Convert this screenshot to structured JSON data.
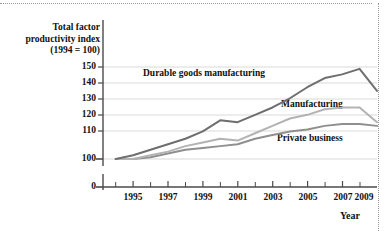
{
  "chart_data": {
    "type": "line",
    "title": "",
    "ylabel": "Total factor productivity index (1994 = 100)",
    "ylabel_line1": "Total factor",
    "ylabel_line2": "productivity index",
    "ylabel_line3": "(1994 = 100)",
    "xlabel": "Year",
    "grid": true,
    "legend_position": "inline-annotations",
    "ylim": [
      100,
      155
    ],
    "y_axis_break": true,
    "y_zero_tick": "0",
    "yticks": [
      100,
      110,
      120,
      130,
      140,
      150
    ],
    "ytick_labels": [
      "100",
      "110",
      "120",
      "130",
      "140",
      "150"
    ],
    "xlim": [
      1994,
      2009.5
    ],
    "xticks_major": [
      1995,
      1997,
      1999,
      2001,
      2003,
      2005,
      2007,
      2009
    ],
    "xtick_labels": [
      "1995",
      "1997",
      "1999",
      "2001",
      "2003",
      "2005",
      "2007",
      "2009"
    ],
    "xticks_minor": [
      1994,
      1996,
      1998,
      2000,
      2002,
      2004,
      2006,
      2008
    ],
    "x": [
      1994,
      1995,
      1996,
      1997,
      1998,
      1999,
      2000,
      2001,
      2002,
      2003,
      2004,
      2005,
      2006,
      2007,
      2008,
      2009
    ],
    "series": [
      {
        "name": "Durable goods manufacturing",
        "color": "#6e6e6e",
        "values": [
          100,
          102,
          105,
          108,
          111,
          115,
          121,
          120,
          124,
          128,
          133,
          139,
          144,
          146,
          149,
          137
        ]
      },
      {
        "name": "Manufacturing",
        "color": "#b3b3b3",
        "values": [
          100,
          100,
          102,
          104,
          107,
          109,
          111,
          110,
          114,
          118,
          122,
          124,
          127,
          128,
          128,
          120
        ]
      },
      {
        "name": "Private business",
        "color": "#8f8f8f",
        "values": [
          100,
          100,
          101,
          103,
          105,
          106,
          107,
          108,
          111,
          113,
          115,
          116,
          118,
          119,
          119,
          118
        ]
      }
    ]
  },
  "annotations": {
    "durable": "Durable goods manufacturing",
    "manufacturing": "Manufacturing",
    "private": "Private business"
  },
  "colors": {
    "durable": "#6e6e6e",
    "manufacturing": "#b3b3b3",
    "private": "#8f8f8f",
    "grid": "#d9d9d9",
    "axis": "#4a4a4a",
    "text": "#111111"
  }
}
